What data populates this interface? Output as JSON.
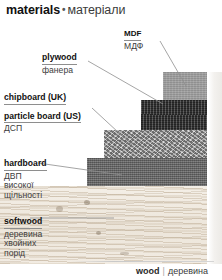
{
  "header": {
    "en": "materials",
    "separator": "•",
    "uk": "матеріали"
  },
  "labels": {
    "mdf": {
      "en": "MDF",
      "uk": "МДФ"
    },
    "plywood": {
      "en": "plywood",
      "uk": "фанера"
    },
    "chipboard": {
      "en_uk_variant": "chipboard (UK)",
      "en_us_variant": "particle board (US)",
      "uk": "ДСП"
    },
    "hardboard": {
      "en": "hardboard",
      "uk_line1": "ДВП",
      "uk_line2": "високої",
      "uk_line3": "щільності"
    },
    "softwood": {
      "en": "softwood",
      "uk_line1": "деревина",
      "uk_line2": "хвойних",
      "uk_line3": "порід"
    }
  },
  "caption": {
    "en": "wood",
    "divider": "|",
    "uk": "деревина"
  },
  "colors": {
    "mdf": "#9d9d9d",
    "plywood": "#3c3c3c",
    "chipboard": "#a3a3a3",
    "hardboard": "#6e6e6e",
    "softwood": "#efe9e0",
    "leader_line": "#8e8e8e",
    "text": "#111111"
  },
  "panels": [
    {
      "name": "mdf",
      "label": "MDF"
    },
    {
      "name": "plywood",
      "label": "plywood"
    },
    {
      "name": "chipboard",
      "label": "chipboard"
    },
    {
      "name": "hardboard",
      "label": "hardboard"
    },
    {
      "name": "softwood",
      "label": "softwood"
    }
  ]
}
